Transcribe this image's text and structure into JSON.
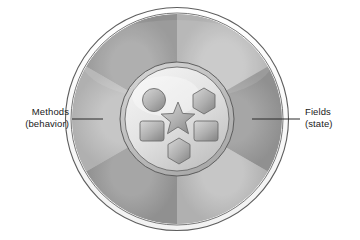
{
  "figure": {
    "type": "object-anatomy-diagram",
    "background_color": "#ffffff"
  },
  "labels": {
    "left": {
      "line1": "Methods",
      "line2": "(behavior)",
      "anchor": "outer-ring-left"
    },
    "right": {
      "line1": "Fields",
      "line2": "(state)",
      "anchor": "outer-ring-right"
    }
  },
  "outer_circle": {
    "name": "object-boundary",
    "center_x": 177,
    "center_y": 119,
    "radius": 112,
    "rim_color": "#ffffff",
    "outline_color": "#4a4a4a"
  },
  "method_ring": {
    "name": "methods-ring",
    "inner_radius": 56,
    "outer_radius": 105,
    "segment_count": 6,
    "segment_colors": [
      "#b9b9b9",
      "#9a9a9a",
      "#b9b9b9",
      "#9a9a9a",
      "#b9b9b9",
      "#9a9a9a"
    ]
  },
  "inner_circle": {
    "name": "fields-core",
    "center_x": 177,
    "center_y": 119,
    "radius": 52,
    "fill_light": "#efefef",
    "fill_dark": "#c4c4c4",
    "outline_color": "#5a5a5a"
  },
  "field_shapes": [
    {
      "id": "field-circle",
      "shape": "circle",
      "cx": 154,
      "cy": 100,
      "size": 12
    },
    {
      "id": "field-hexagon-top",
      "shape": "hexagon",
      "cx": 204,
      "cy": 100,
      "size": 13
    },
    {
      "id": "field-star",
      "shape": "star",
      "cx": 178,
      "cy": 117,
      "size": 16
    },
    {
      "id": "field-rect-left",
      "shape": "rounded-rectangle",
      "cx": 152,
      "cy": 131,
      "size": 13
    },
    {
      "id": "field-rect-right",
      "shape": "rounded-rectangle",
      "cx": 206,
      "cy": 131,
      "size": 13
    },
    {
      "id": "field-hexagon-bottom",
      "shape": "hexagon",
      "cx": 179,
      "cy": 150,
      "size": 13
    }
  ],
  "shape_style": {
    "fill_light": "#c9c9c9",
    "fill_dark": "#8d8d8d",
    "outline_color": "#6e6e6e"
  },
  "leader_lines": {
    "left": {
      "x1": 72,
      "y1": 119,
      "x2": 103,
      "y2": 119
    },
    "right": {
      "x1": 252,
      "y1": 119,
      "x2": 300,
      "y2": 119
    },
    "color": "#2a2a2a"
  }
}
